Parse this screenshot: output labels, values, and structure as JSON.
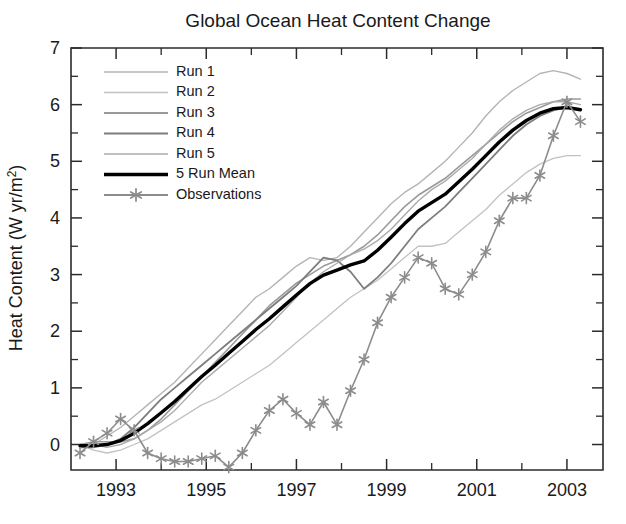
{
  "chart_data": {
    "type": "line",
    "title": "Global Ocean Heat Content Change",
    "xlabel": "",
    "ylabel": "Heat Content (W yr/m2)",
    "ylabel_display": "Heat Content (W yr/m²)",
    "xlim": [
      1992.0,
      2003.8
    ],
    "ylim": [
      0,
      7
    ],
    "ylim_display": [
      -0.45,
      7
    ],
    "xticks": [
      1993,
      1995,
      1997,
      1999,
      2001,
      2003
    ],
    "xticklabels": [
      "1993",
      "1995",
      "1997",
      "1999",
      "2001",
      "2003"
    ],
    "xticks_minor": [
      1992,
      1994,
      1996,
      1998,
      2000,
      2002
    ],
    "yticks": [
      0,
      1,
      2,
      3,
      4,
      5,
      6,
      7
    ],
    "yticklabels": [
      "0",
      "1",
      "2",
      "3",
      "4",
      "5",
      "6",
      "7"
    ],
    "yticks_minor": [
      0.5,
      1.5,
      2.5,
      3.5,
      4.5,
      5.5,
      6.5
    ],
    "grid": false,
    "legend_position": "upper left",
    "x": [
      1992.2,
      1992.5,
      1992.8,
      1993.1,
      1993.4,
      1993.7,
      1994.0,
      1994.3,
      1994.6,
      1994.9,
      1995.2,
      1995.5,
      1995.8,
      1996.1,
      1996.4,
      1996.7,
      1997.0,
      1997.3,
      1997.6,
      1997.9,
      1998.2,
      1998.5,
      1998.8,
      1999.1,
      1999.4,
      1999.7,
      2000.0,
      2000.3,
      2000.6,
      2000.9,
      2001.2,
      2001.5,
      2001.8,
      2002.1,
      2002.4,
      2002.7,
      2003.0,
      2003.3
    ],
    "series": [
      {
        "name": "Run 1",
        "color": "#b4b4b4",
        "width": 1.4,
        "values": [
          -0.05,
          0.0,
          0.15,
          0.3,
          0.5,
          0.7,
          0.9,
          1.1,
          1.35,
          1.6,
          1.85,
          2.1,
          2.35,
          2.6,
          2.75,
          2.95,
          3.15,
          3.3,
          3.25,
          3.3,
          3.5,
          3.75,
          4.0,
          4.25,
          4.45,
          4.6,
          4.8,
          5.0,
          5.25,
          5.5,
          5.8,
          6.05,
          6.25,
          6.4,
          6.55,
          6.6,
          6.55,
          6.45
        ]
      },
      {
        "name": "Run 2",
        "color": "#c2c2c2",
        "width": 1.3,
        "values": [
          0.0,
          -0.1,
          -0.15,
          -0.1,
          0.0,
          0.1,
          0.25,
          0.4,
          0.55,
          0.7,
          0.8,
          0.95,
          1.1,
          1.25,
          1.4,
          1.6,
          1.8,
          2.0,
          2.2,
          2.4,
          2.6,
          2.75,
          2.9,
          3.1,
          3.3,
          3.5,
          3.5,
          3.55,
          3.75,
          3.95,
          4.15,
          4.4,
          4.6,
          4.8,
          4.95,
          5.05,
          5.1,
          5.1
        ]
      },
      {
        "name": "Run 3",
        "color": "#9a9a9a",
        "width": 1.6,
        "values": [
          0.0,
          0.05,
          0.05,
          0.05,
          0.1,
          0.25,
          0.45,
          0.7,
          0.95,
          1.2,
          1.45,
          1.7,
          1.95,
          2.2,
          2.45,
          2.65,
          2.85,
          3.0,
          3.15,
          3.25,
          3.35,
          3.5,
          3.7,
          3.95,
          4.2,
          4.4,
          4.55,
          4.7,
          4.9,
          5.1,
          5.3,
          5.5,
          5.7,
          5.85,
          5.95,
          6.05,
          6.1,
          6.1
        ]
      },
      {
        "name": "Run 4",
        "color": "#7d7d7d",
        "width": 1.8,
        "values": [
          -0.05,
          -0.05,
          0.0,
          0.1,
          0.3,
          0.55,
          0.8,
          1.0,
          1.2,
          1.4,
          1.6,
          1.8,
          2.0,
          2.2,
          2.4,
          2.6,
          2.8,
          3.05,
          3.3,
          3.25,
          3.05,
          2.75,
          2.95,
          3.2,
          3.5,
          3.8,
          4.0,
          4.2,
          4.45,
          4.7,
          4.95,
          5.2,
          5.45,
          5.65,
          5.8,
          5.9,
          5.95,
          5.9
        ]
      },
      {
        "name": "Run 5",
        "color": "#ababab",
        "width": 1.4,
        "values": [
          0.0,
          0.0,
          -0.05,
          0.0,
          0.1,
          0.25,
          0.4,
          0.6,
          0.85,
          1.1,
          1.3,
          1.5,
          1.7,
          1.9,
          2.1,
          2.35,
          2.6,
          2.85,
          3.05,
          3.2,
          3.35,
          3.45,
          3.6,
          3.8,
          4.05,
          4.3,
          4.5,
          4.65,
          4.85,
          5.05,
          5.3,
          5.55,
          5.75,
          5.9,
          6.0,
          6.05,
          6.05,
          6.0
        ]
      },
      {
        "name": "5 Run Mean",
        "color": "#000000",
        "width": 3.4,
        "values": [
          -0.02,
          -0.02,
          0.0,
          0.07,
          0.2,
          0.37,
          0.56,
          0.76,
          0.98,
          1.2,
          1.4,
          1.61,
          1.82,
          2.03,
          2.22,
          2.43,
          2.64,
          2.84,
          2.99,
          3.08,
          3.17,
          3.24,
          3.43,
          3.66,
          3.9,
          4.12,
          4.27,
          4.42,
          4.64,
          4.86,
          5.1,
          5.34,
          5.55,
          5.72,
          5.85,
          5.93,
          5.95,
          5.91
        ]
      },
      {
        "name": "Observations",
        "color": "#8c8c8c",
        "width": 1.6,
        "marker": "asterisk",
        "values": [
          -0.15,
          0.05,
          0.2,
          0.45,
          0.25,
          -0.15,
          -0.25,
          -0.3,
          -0.3,
          -0.25,
          -0.2,
          -0.4,
          -0.15,
          0.25,
          0.6,
          0.8,
          0.55,
          0.35,
          0.75,
          0.35,
          0.95,
          1.5,
          2.15,
          2.6,
          2.95,
          3.3,
          3.2,
          2.75,
          2.65,
          3.0,
          3.4,
          3.95,
          4.35,
          4.35,
          4.75,
          5.45,
          6.05,
          5.7
        ]
      }
    ]
  },
  "legend": {
    "entries": [
      {
        "label": "Run 1",
        "color": "#b4b4b4",
        "width": 1.4
      },
      {
        "label": "Run 2",
        "color": "#c2c2c2",
        "width": 1.3
      },
      {
        "label": "Run 3",
        "color": "#9a9a9a",
        "width": 1.8
      },
      {
        "label": "Run 4",
        "color": "#7d7d7d",
        "width": 2.0
      },
      {
        "label": "Run 5",
        "color": "#ababab",
        "width": 1.5
      },
      {
        "label": "5 Run Mean",
        "color": "#000000",
        "width": 3.6
      },
      {
        "label": "Observations",
        "color": "#8c8c8c",
        "width": 1.8,
        "marker": "asterisk"
      }
    ]
  },
  "colors": {
    "axis": "#2b2b2b",
    "text": "#1a1a1a",
    "background": "#ffffff",
    "mean_line": "#000000",
    "observations": "#8c8c8c"
  }
}
